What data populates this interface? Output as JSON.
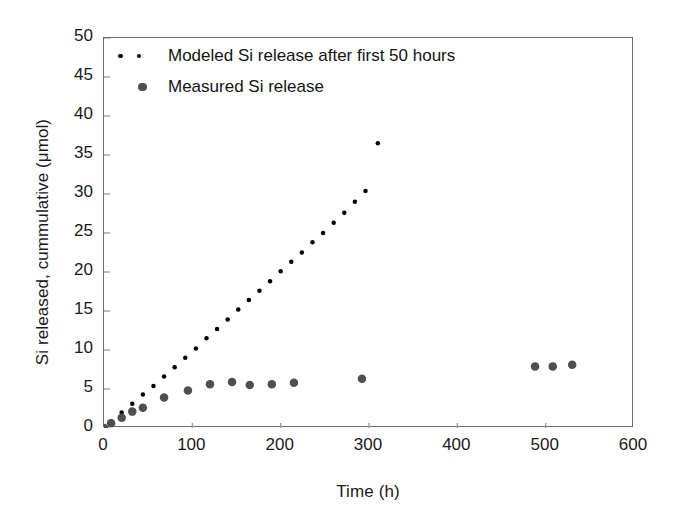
{
  "chart_data": {
    "type": "scatter",
    "title": "",
    "xlabel": "Time (h)",
    "ylabel": "Si released, cummulative (μmol)",
    "xlim": [
      0,
      600
    ],
    "ylim": [
      0,
      50
    ],
    "xticks": [
      0,
      100,
      200,
      300,
      400,
      500,
      600
    ],
    "yticks": [
      0,
      5,
      10,
      15,
      20,
      25,
      30,
      35,
      40,
      45,
      50
    ],
    "grid": false,
    "legend_position": "top-left-inside",
    "series": [
      {
        "name": "Modeled Si release after first 50 hours",
        "marker": "small-dot",
        "color": "#000000",
        "marker_size": 4.5,
        "x": [
          8,
          20,
          32,
          44,
          56,
          68,
          80,
          92,
          104,
          116,
          128,
          140,
          152,
          164,
          176,
          188,
          200,
          212,
          224,
          236,
          248,
          260,
          272,
          284,
          296,
          310
        ],
        "y": [
          0.8,
          2.0,
          3.1,
          4.3,
          5.4,
          6.6,
          7.8,
          9.0,
          10.2,
          11.5,
          12.7,
          13.9,
          15.2,
          16.4,
          17.6,
          18.8,
          20.1,
          21.3,
          22.5,
          23.8,
          25.0,
          26.3,
          27.6,
          29.0,
          30.4,
          36.5
        ]
      },
      {
        "name": "Measured Si release",
        "marker": "large-dot",
        "color": "#4f4f4f",
        "marker_size": 8.5,
        "x": [
          0,
          8,
          20,
          32,
          44,
          68,
          95,
          120,
          145,
          165,
          190,
          215,
          292,
          488,
          508,
          530
        ],
        "y": [
          0.0,
          0.6,
          1.3,
          2.1,
          2.6,
          3.9,
          4.8,
          5.6,
          5.9,
          5.5,
          5.6,
          5.8,
          6.3,
          7.9,
          7.9,
          8.1
        ]
      }
    ]
  },
  "legend": {
    "modeled_label": "Modeled Si release after first 50 hours",
    "measured_label": "Measured Si release",
    "modeled_marker": "small-black-dot",
    "measured_marker": "large-gray-dot"
  },
  "axes": {
    "y_title": "Si released, cummulative (μmol)",
    "x_title": "Time (h)",
    "y_tick_labels": [
      "50",
      "45",
      "40",
      "35",
      "30",
      "25",
      "20",
      "15",
      "10",
      "5",
      "0"
    ],
    "x_tick_labels": [
      "0",
      "100",
      "200",
      "300",
      "400",
      "500",
      "600"
    ]
  },
  "colors": {
    "modeled": "#000000",
    "measured": "#4f4f4f",
    "frame": "#6e6e6e",
    "text": "#1a1a1a",
    "background": "#ffffff"
  }
}
